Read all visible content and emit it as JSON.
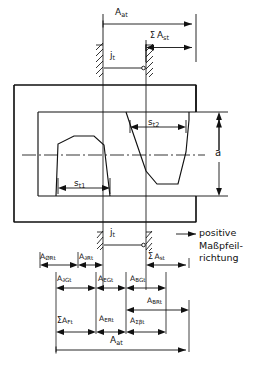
{
  "figure": {
    "type": "engineering-drawing",
    "language": "de"
  },
  "labels": {
    "top_overall": {
      "base": "A",
      "sub": "at"
    },
    "top_sum_st": {
      "sigma": "Σ",
      "base": "A",
      "sub": "st"
    },
    "backlash": {
      "base": "j",
      "sub": "t"
    },
    "tooth_thickness_1": {
      "base": "s",
      "sub": "t1"
    },
    "space_width_2": {
      "base": "s",
      "sub": "t2"
    },
    "center_distance": {
      "base": "a"
    },
    "row1_left": {
      "base": "A",
      "sub": "ØRt"
    },
    "row1_mid": {
      "base": "A",
      "sub": "∂Rt"
    },
    "row1_right": {
      "sigma": "Σ",
      "base": "A",
      "sub": "st"
    },
    "row1_jt": {
      "base": "j",
      "sub": "t"
    },
    "row2_a": {
      "base": "A",
      "sub": "∂Gt"
    },
    "row2_b": {
      "base": "A",
      "sub": "EGt"
    },
    "row2_c": {
      "base": "A",
      "sub": "BGt"
    },
    "row3_right": {
      "base": "A",
      "sub": "BRt"
    },
    "row4_a": {
      "sigma": "Σ",
      "base": "A",
      "sub": "Ft"
    },
    "row4_b": {
      "base": "A",
      "sub": "ERt"
    },
    "row4_c": {
      "base": "A",
      "sub": "Σβt"
    },
    "bottom_overall": {
      "base": "A",
      "sub": "at"
    },
    "arrow_note_line1": "positive",
    "arrow_note_line2": "Maßpfeil-",
    "arrow_note_line3": "richtung"
  },
  "style": {
    "line_color": "#111111",
    "background": "#ffffff",
    "stroke_width": 1.0
  }
}
